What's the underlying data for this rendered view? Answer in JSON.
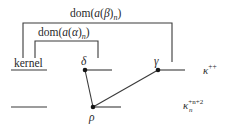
{
  "diagram": {
    "brackets": [
      {
        "id": "outer",
        "label": "dom(a(β)n)",
        "label_parts": {
          "pre": "dom(",
          "a": "a",
          "open": "(",
          "greek": "β",
          "close": ")",
          "sub": "n",
          "end": ")"
        }
      },
      {
        "id": "inner",
        "label": "dom(a(α)n)",
        "label_parts": {
          "pre": "dom(",
          "a": "a",
          "open": "(",
          "greek": "α",
          "close": ")",
          "sub": "n",
          "end": ")"
        }
      }
    ],
    "row_labels": {
      "kernel": "kernel",
      "top_right": {
        "base": "κ",
        "sup": "++"
      },
      "bottom_right": {
        "base": "κ",
        "sup": "+n+2",
        "sub": "n"
      }
    },
    "nodes": [
      {
        "id": "delta",
        "label": "δ"
      },
      {
        "id": "gamma",
        "label": "γ"
      },
      {
        "id": "rho",
        "label": "ρ"
      }
    ],
    "colors": {
      "line": "#3a3a3a",
      "dot": "#151515",
      "text": "#2a2a2a",
      "background": "#ffffff"
    }
  }
}
